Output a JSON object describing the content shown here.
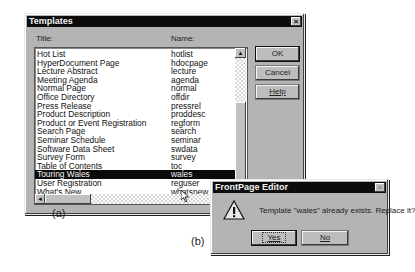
{
  "templates_dialog": {
    "title": "Templates",
    "close_glyph": "×",
    "column_title_label": "Title:",
    "column_name_label": "Name:",
    "rows": [
      {
        "title": "Hot List",
        "name": "hotlist"
      },
      {
        "title": "HyperDocument Page",
        "name": "hdocpage"
      },
      {
        "title": "Lecture Abstract",
        "name": "lecture"
      },
      {
        "title": "Meeting Agenda",
        "name": "agenda"
      },
      {
        "title": "Normal Page",
        "name": "normal"
      },
      {
        "title": "Office Directory",
        "name": "offdir"
      },
      {
        "title": "Press Release",
        "name": "pressrel"
      },
      {
        "title": "Product Description",
        "name": "proddesc"
      },
      {
        "title": "Product or Event Registration",
        "name": "regform"
      },
      {
        "title": "Search Page",
        "name": "search"
      },
      {
        "title": "Seminar Schedule",
        "name": "seminar"
      },
      {
        "title": "Software Data Sheet",
        "name": "swdata"
      },
      {
        "title": "Survey Form",
        "name": "survey"
      },
      {
        "title": "Table of Contents",
        "name": "toc"
      },
      {
        "title": "Touring Wales",
        "name": "wales",
        "selected": true
      },
      {
        "title": "User Registration",
        "name": "reguser"
      },
      {
        "title": "What's New",
        "name": "whatsnew"
      }
    ],
    "buttons": {
      "ok": "OK",
      "cancel": "Cancel",
      "help": "Help"
    },
    "scroll_up_glyph": "▲",
    "scroll_left_glyph": "◄"
  },
  "confirm_dialog": {
    "title": "FrontPage Editor",
    "close_glyph": "×",
    "message": "Template \"wales\" already exists.  Replace it?",
    "warning_glyph": "!",
    "buttons": {
      "yes": "Yes",
      "no": "No"
    }
  },
  "captions": {
    "a": "(a)",
    "b": "(b)"
  }
}
